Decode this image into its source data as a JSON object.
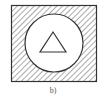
{
  "figure": {
    "caption": "b)",
    "colors": {
      "stroke": "#333333",
      "hatch": "#444444",
      "fill": "#ffffff"
    },
    "shapes": [
      {
        "type": "square",
        "style": "diagonal-hatch"
      },
      {
        "type": "circle",
        "style": "white-fill"
      },
      {
        "type": "triangle",
        "style": "outline"
      }
    ]
  }
}
